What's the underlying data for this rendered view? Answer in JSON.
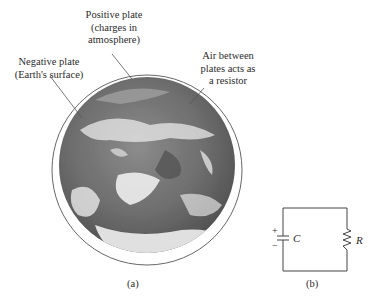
{
  "figure_a": {
    "labels": {
      "positive_plate": [
        "Positive plate",
        "(charges in",
        "atmosphere)"
      ],
      "negative_plate": [
        "Negative plate",
        "(Earth's surface)"
      ],
      "air": [
        "Air between",
        "plates acts as",
        "a resistor"
      ]
    },
    "caption": "(a)"
  },
  "figure_b": {
    "capacitor_symbol": "C",
    "resistor_symbol": "R",
    "plus": "+",
    "minus": "−",
    "caption": "(b)"
  },
  "colors": {
    "text": "#2b2b2b",
    "line": "#555555",
    "ocean": "#6a6a6a",
    "cloud": "#eeeeee"
  }
}
